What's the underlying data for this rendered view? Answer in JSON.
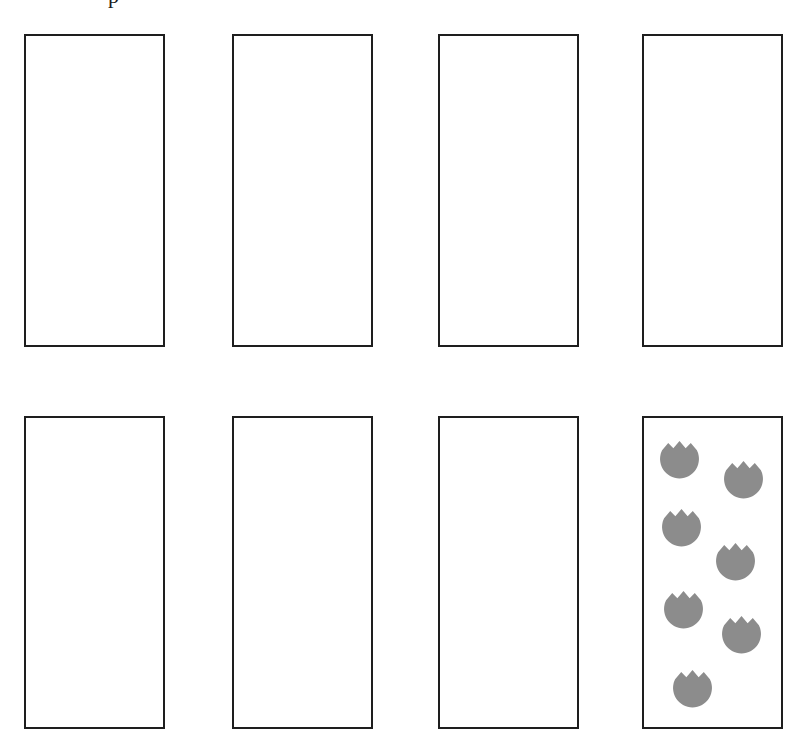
{
  "header": {
    "cropped_text_fragment": "p"
  },
  "worksheet": {
    "layout": "2 rows x 4 columns of empty rectangular boxes",
    "flower_color": "#8c8c8c",
    "border_color": "#1e1e1e",
    "boxes": [
      {
        "row": 1,
        "col": 1,
        "count": 0
      },
      {
        "row": 1,
        "col": 2,
        "count": 0
      },
      {
        "row": 1,
        "col": 3,
        "count": 0
      },
      {
        "row": 1,
        "col": 4,
        "count": 0
      },
      {
        "row": 2,
        "col": 1,
        "count": 0
      },
      {
        "row": 2,
        "col": 2,
        "count": 0
      },
      {
        "row": 2,
        "col": 3,
        "count": 0
      },
      {
        "row": 2,
        "col": 4,
        "count": 7,
        "icon": "tulip-icon"
      }
    ]
  }
}
